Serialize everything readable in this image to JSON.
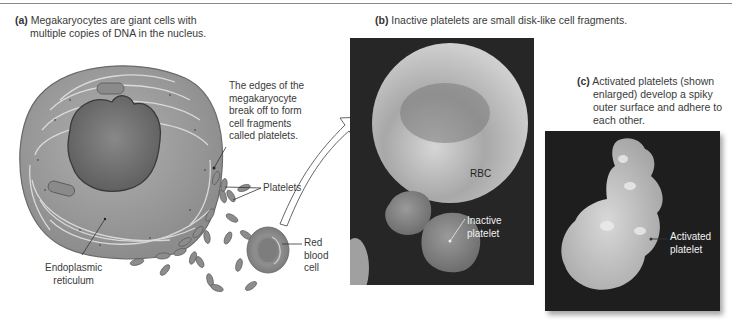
{
  "figure": {
    "panel_a": {
      "letter": "(a)",
      "caption_line1": "Megakaryocytes are giant cells with",
      "caption_line2": "multiple copies of DNA in the nucleus.",
      "annotation_edges": [
        "The edges of the",
        "megakaryocyte",
        "break off to form",
        "cell fragments",
        "called platelets."
      ],
      "label_platelets": "Platelets",
      "label_er": [
        "Endoplasmic",
        "reticulum"
      ],
      "label_rbc": [
        "Red",
        "blood",
        "cell"
      ]
    },
    "panel_b": {
      "letter": "(b)",
      "caption": "Inactive platelets are small disk-like cell fragments.",
      "label_rbc": "RBC",
      "label_inactive": [
        "Inactive",
        "platelet"
      ]
    },
    "panel_c": {
      "letter": "(c)",
      "caption": [
        "Activated platelets (shown",
        "enlarged) develop a spiky",
        "outer surface and adhere to",
        "each other."
      ],
      "label_activated": [
        "Activated",
        "platelet"
      ]
    },
    "colors": {
      "cell_fill": "#9b9b9b",
      "nucleus_fill": "#6e6e6e",
      "sem_background": "#262626",
      "rbc_fill": "#8a8a8a"
    }
  }
}
